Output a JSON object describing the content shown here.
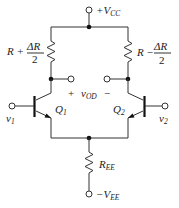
{
  "diagram": {
    "supplies": {
      "positive": {
        "prefix": "+V",
        "sub": "CC"
      },
      "negative": {
        "prefix": "−V",
        "sub": "EE"
      }
    },
    "resistors": {
      "left": {
        "base": "R +",
        "num": "ΔR",
        "den": "2"
      },
      "right": {
        "base": "R −",
        "num": "ΔR",
        "den": "2"
      },
      "tail": {
        "base": "R",
        "sub": "EE"
      }
    },
    "output": {
      "plus": "+",
      "base": "v",
      "sub": "OD",
      "minus": "−"
    },
    "transistors": [
      {
        "base": "Q",
        "sub": "1"
      },
      {
        "base": "Q",
        "sub": "2"
      }
    ],
    "inputs": [
      {
        "base": "v",
        "sub": "1"
      },
      {
        "base": "v",
        "sub": "2"
      }
    ],
    "colors": {
      "line": "#333333",
      "background": "#ffffff"
    }
  }
}
